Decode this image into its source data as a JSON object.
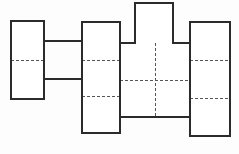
{
  "figure": {
    "caption": "",
    "background_color": "#fdfdfd",
    "outline_color": "#2b2b2b",
    "divider_color": "#555555",
    "fill_color": "#ffffff",
    "outline_width": 1.6,
    "divider_width": 1.0,
    "divider_dash": "3 2",
    "canvas": {
      "width": 239,
      "height": 154
    }
  },
  "blocks": [
    {
      "id": "block-left",
      "name": "left-column-block",
      "x": 11,
      "y": 21,
      "width": 33,
      "height": 78,
      "cell_count": 2,
      "row_dividers": [
        60
      ]
    },
    {
      "id": "block-second",
      "name": "second-column-block",
      "x": 82,
      "y": 22,
      "width": 38,
      "height": 111,
      "cell_count": 3,
      "row_dividers": [
        60,
        96
      ]
    },
    {
      "id": "block-top-square",
      "name": "top-protruding-square",
      "x": 135,
      "y": 3,
      "width": 38,
      "height": 40,
      "cell_count": 1,
      "row_dividers": []
    },
    {
      "id": "block-middle-grid",
      "name": "middle-grid-block",
      "x": 120,
      "y": 43,
      "width": 70,
      "height": 74,
      "columns": 2,
      "rows": 2,
      "col_dividers": [
        155
      ],
      "row_dividers": [
        80
      ]
    },
    {
      "id": "block-right",
      "name": "right-column-block",
      "x": 190,
      "y": 22,
      "width": 40,
      "height": 114,
      "cell_count": 3,
      "row_dividers": [
        60,
        98
      ]
    }
  ],
  "connectors": [
    {
      "id": "connector-upper",
      "name": "upper-connector-bar",
      "x1": 44,
      "y1": 41,
      "x2": 82,
      "y2": 41
    },
    {
      "id": "connector-lower",
      "name": "lower-connector-bar",
      "x1": 44,
      "y1": 79,
      "x2": 82,
      "y2": 79
    }
  ],
  "cells": [
    {
      "name": "cell-left-top",
      "label": ""
    },
    {
      "name": "cell-left-bottom",
      "label": ""
    },
    {
      "name": "cell-second-top",
      "label": ""
    },
    {
      "name": "cell-second-middle",
      "label": ""
    },
    {
      "name": "cell-second-bottom",
      "label": ""
    },
    {
      "name": "cell-top-square",
      "label": ""
    },
    {
      "name": "cell-mid-tl",
      "label": ""
    },
    {
      "name": "cell-mid-tr",
      "label": ""
    },
    {
      "name": "cell-mid-bl",
      "label": ""
    },
    {
      "name": "cell-mid-br",
      "label": ""
    },
    {
      "name": "cell-right-top",
      "label": ""
    },
    {
      "name": "cell-right-middle",
      "label": ""
    },
    {
      "name": "cell-right-bottom",
      "label": ""
    }
  ]
}
